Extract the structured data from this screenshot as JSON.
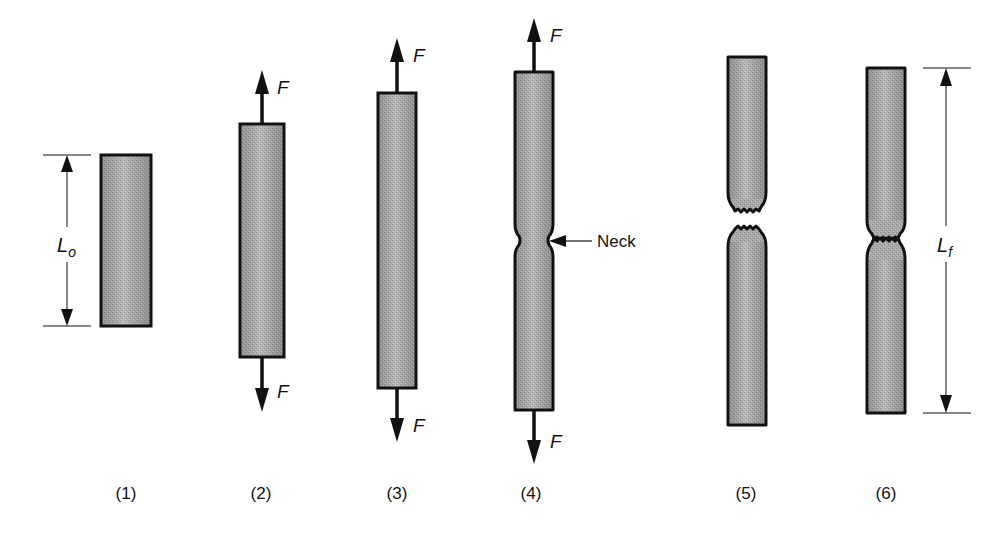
{
  "figure": {
    "type": "tensile-test-stages",
    "specimen_fill": "#a9a9a9",
    "outline_color": "#111111",
    "background": "#ffffff"
  },
  "labels": {
    "force": "F",
    "original_length": "L",
    "original_length_sub": "o",
    "final_length": "L",
    "final_length_sub": "f",
    "neck": "Neck"
  },
  "stages": [
    {
      "id": 1,
      "label": "(1)",
      "description": "Original specimen, no load"
    },
    {
      "id": 2,
      "label": "(2)",
      "description": "Elastic elongation under force F"
    },
    {
      "id": 3,
      "label": "(3)",
      "description": "Uniform plastic elongation"
    },
    {
      "id": 4,
      "label": "(4)",
      "description": "Necking begins"
    },
    {
      "id": 5,
      "label": "(5)",
      "description": "Fracture"
    },
    {
      "id": 6,
      "label": "(6)",
      "description": "Pieces reassembled, final length measured"
    }
  ]
}
